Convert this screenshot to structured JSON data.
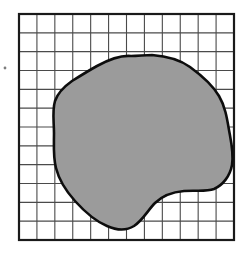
{
  "figure": {
    "title": "Irregular shaded region overlaid on a square grid",
    "description": "A closed irregular blob filled with gray, drawn with a heavy black outline, over a 12 by 12 square grid with a thicker border frame.",
    "background_color": "#ffffff"
  },
  "grid": {
    "name": "square-grid",
    "columns": 12,
    "rows": 12,
    "cell_width": 17.9,
    "cell_height": 18.8,
    "origin_x": 19,
    "origin_y": 14,
    "width": 215,
    "height": 226,
    "line_color": "#4a4a4a",
    "line_width": 1.1,
    "border_color": "#1a1a1a",
    "border_width": 2.2,
    "border_label": "grid-frame"
  },
  "region": {
    "name": "shaded-region",
    "fill_color": "#9b9b9b",
    "stroke_color": "#0d0d0d",
    "stroke_width": 2.6,
    "bounds": {
      "left_x": 54,
      "right_x": 232,
      "top_y": 56,
      "bottom_y": 229
    },
    "path": "M 131 56 C 120 55 108 60 97 66 C 88 71 80 76 72 81 C 65 86 58 92 55 101 C 52 111 54 122 54 133 C 54 145 53 157 56 168 C 59 180 66 191 75 201 C 84 211 95 221 107 226 C 116 230 126 231 134 226 C 143 220 148 210 155 203 C 163 195 173 192 184 191 C 195 190 206 192 214 189 C 223 185 230 176 232 165 C 234 153 231 141 229 130 C 227 118 225 106 219 96 C 212 84 201 75 190 67 C 179 59 165 56 152 55 C 145 55 138 56 131 56 Z"
  },
  "artifact": {
    "name": "stray-mark",
    "x": 5,
    "y": 68,
    "radius": 1.4,
    "color": "#7d7d7d",
    "label": "small stray speck left of grid"
  },
  "chart_data": {
    "type": "scatter",
    "title": "Irregular shaded region overlaid on a square grid",
    "xlabel": "",
    "ylabel": "",
    "grid": true,
    "legend": "none",
    "xlim": [
      0,
      12
    ],
    "ylim": [
      0,
      12
    ],
    "categories": [],
    "values": [],
    "annotations": [
      "12 x 12 unit square grid",
      "single closed irregular gray region",
      "region spans roughly columns 2 through 12 and rows 3 through 12"
    ]
  }
}
